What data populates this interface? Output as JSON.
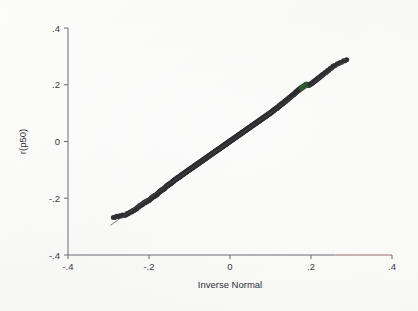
{
  "figure": {
    "background_color": "#fbfbfa",
    "plot_area": {
      "left": 68,
      "top": 28,
      "right": 392,
      "bottom": 255
    }
  },
  "chart_data": {
    "type": "scatter",
    "title": "",
    "subtitle": "",
    "xlabel": "Inverse Normal",
    "ylabel": "r(p50)",
    "xlim": [
      -0.4,
      0.4
    ],
    "ylim": [
      -0.4,
      0.4
    ],
    "xticks": [
      -0.4,
      -0.2,
      0,
      0.2,
      0.4
    ],
    "yticks": [
      -0.4,
      -0.2,
      0,
      0.2,
      0.4
    ],
    "xticklabels": [
      "-.4",
      "-.2",
      "0",
      ".2",
      ".4"
    ],
    "yticklabels": [
      "-.4",
      "-.2",
      "0",
      ".2",
      ".4"
    ],
    "grid": false,
    "legend": null,
    "legend_position": "none",
    "annotations": [],
    "marker_color": "#2f2f33",
    "highlight_color": "#2e5c33",
    "reference_line": {
      "label": "45-degree reference line",
      "color": "#4b4b52",
      "x": [
        -0.295,
        0.285
      ],
      "y": [
        -0.295,
        0.285
      ]
    },
    "series": [
      {
        "name": "quantiles",
        "marker": "circle",
        "color": "#2f2f33",
        "x": [
          -0.288,
          -0.272,
          -0.258,
          -0.25,
          -0.243,
          -0.237,
          -0.231,
          -0.226,
          -0.221,
          -0.216,
          -0.212,
          -0.208,
          -0.204,
          -0.2,
          -0.196,
          -0.193,
          -0.189,
          -0.186,
          -0.183,
          -0.18,
          -0.177,
          -0.174,
          -0.171,
          -0.168,
          -0.165,
          -0.162,
          -0.16,
          -0.157,
          -0.154,
          -0.152,
          -0.149,
          -0.147,
          -0.144,
          -0.142,
          -0.139,
          -0.137,
          -0.135,
          -0.132,
          -0.13,
          -0.128,
          -0.125,
          -0.123,
          -0.121,
          -0.119,
          -0.117,
          -0.115,
          -0.112,
          -0.11,
          -0.108,
          -0.106,
          -0.104,
          -0.102,
          -0.1,
          -0.098,
          -0.096,
          -0.094,
          -0.092,
          -0.09,
          -0.088,
          -0.086,
          -0.084,
          -0.082,
          -0.08,
          -0.078,
          -0.076,
          -0.074,
          -0.072,
          -0.07,
          -0.068,
          -0.066,
          -0.064,
          -0.062,
          -0.06,
          -0.058,
          -0.056,
          -0.054,
          -0.052,
          -0.05,
          -0.048,
          -0.046,
          -0.044,
          -0.042,
          -0.04,
          -0.038,
          -0.036,
          -0.034,
          -0.032,
          -0.03,
          -0.028,
          -0.026,
          -0.024,
          -0.022,
          -0.02,
          -0.018,
          -0.016,
          -0.014,
          -0.012,
          -0.01,
          -0.008,
          -0.006,
          -0.004,
          -0.002,
          0.0,
          0.002,
          0.004,
          0.006,
          0.008,
          0.01,
          0.012,
          0.014,
          0.016,
          0.018,
          0.02,
          0.022,
          0.024,
          0.026,
          0.028,
          0.03,
          0.032,
          0.034,
          0.036,
          0.038,
          0.04,
          0.042,
          0.044,
          0.046,
          0.048,
          0.05,
          0.052,
          0.054,
          0.056,
          0.058,
          0.06,
          0.062,
          0.064,
          0.066,
          0.068,
          0.07,
          0.072,
          0.074,
          0.076,
          0.078,
          0.08,
          0.082,
          0.084,
          0.086,
          0.088,
          0.09,
          0.092,
          0.094,
          0.096,
          0.098,
          0.1,
          0.102,
          0.104,
          0.106,
          0.108,
          0.11,
          0.112,
          0.115,
          0.117,
          0.119,
          0.121,
          0.123,
          0.125,
          0.128,
          0.13,
          0.132,
          0.135,
          0.137,
          0.139,
          0.142,
          0.144,
          0.147,
          0.149,
          0.152,
          0.154,
          0.157,
          0.16,
          0.162,
          0.165,
          0.168,
          0.171,
          0.174,
          0.177,
          0.18,
          0.183,
          0.186,
          0.189,
          0.193,
          0.196,
          0.2,
          0.204,
          0.208,
          0.212,
          0.216,
          0.221,
          0.226,
          0.231,
          0.237,
          0.243,
          0.25,
          0.258,
          0.272,
          0.288
        ],
        "y": [
          -0.268,
          -0.262,
          -0.259,
          -0.252,
          -0.247,
          -0.242,
          -0.237,
          -0.23,
          -0.225,
          -0.221,
          -0.216,
          -0.213,
          -0.21,
          -0.207,
          -0.202,
          -0.198,
          -0.194,
          -0.192,
          -0.189,
          -0.186,
          -0.181,
          -0.177,
          -0.174,
          -0.171,
          -0.168,
          -0.166,
          -0.162,
          -0.158,
          -0.155,
          -0.152,
          -0.15,
          -0.148,
          -0.145,
          -0.142,
          -0.139,
          -0.136,
          -0.134,
          -0.131,
          -0.129,
          -0.127,
          -0.125,
          -0.123,
          -0.12,
          -0.118,
          -0.116,
          -0.114,
          -0.111,
          -0.109,
          -0.107,
          -0.105,
          -0.103,
          -0.101,
          -0.099,
          -0.097,
          -0.095,
          -0.093,
          -0.091,
          -0.089,
          -0.087,
          -0.085,
          -0.083,
          -0.081,
          -0.079,
          -0.077,
          -0.075,
          -0.073,
          -0.071,
          -0.069,
          -0.067,
          -0.065,
          -0.063,
          -0.061,
          -0.059,
          -0.057,
          -0.055,
          -0.053,
          -0.051,
          -0.049,
          -0.047,
          -0.045,
          -0.043,
          -0.041,
          -0.039,
          -0.037,
          -0.035,
          -0.033,
          -0.031,
          -0.029,
          -0.027,
          -0.025,
          -0.023,
          -0.021,
          -0.019,
          -0.017,
          -0.015,
          -0.013,
          -0.011,
          -0.009,
          -0.007,
          -0.005,
          -0.003,
          -0.001,
          0.001,
          0.003,
          0.005,
          0.007,
          0.009,
          0.011,
          0.013,
          0.015,
          0.017,
          0.019,
          0.021,
          0.023,
          0.025,
          0.027,
          0.029,
          0.031,
          0.033,
          0.035,
          0.037,
          0.039,
          0.041,
          0.043,
          0.045,
          0.047,
          0.049,
          0.051,
          0.053,
          0.055,
          0.057,
          0.059,
          0.061,
          0.063,
          0.065,
          0.067,
          0.069,
          0.071,
          0.073,
          0.075,
          0.077,
          0.079,
          0.081,
          0.083,
          0.085,
          0.087,
          0.089,
          0.091,
          0.093,
          0.095,
          0.097,
          0.099,
          0.101,
          0.103,
          0.105,
          0.108,
          0.11,
          0.112,
          0.115,
          0.117,
          0.119,
          0.122,
          0.124,
          0.127,
          0.129,
          0.132,
          0.134,
          0.137,
          0.14,
          0.142,
          0.145,
          0.148,
          0.151,
          0.154,
          0.157,
          0.16,
          0.163,
          0.166,
          0.169,
          0.173,
          0.176,
          0.18,
          0.184,
          0.187,
          0.19,
          0.193,
          0.196,
          0.199,
          0.202,
          0.198,
          0.2,
          0.203,
          0.207,
          0.212,
          0.216,
          0.221,
          0.226,
          0.232,
          0.238,
          0.244,
          0.251,
          0.259,
          0.268,
          0.278,
          0.288
        ],
        "highlight_range": [
          0.176,
          0.196
        ]
      }
    ]
  }
}
